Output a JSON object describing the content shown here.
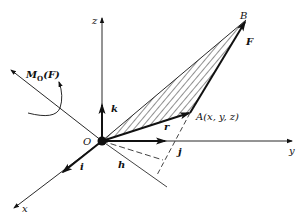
{
  "diagram": {
    "axes": {
      "x_label": "x",
      "y_label": "y",
      "z_label": "z"
    },
    "unit_vectors": {
      "i": "i",
      "j": "j",
      "k": "k"
    },
    "points": {
      "origin": "O",
      "A": "A(x, y, z)",
      "B": "B"
    },
    "vectors": {
      "position": "r",
      "force": "F"
    },
    "moment_label_main": "M",
    "moment_label_sub": "O",
    "moment_label_tail": "(F)",
    "arm_label": "h",
    "colors": {
      "line": "#111111",
      "hatch": "#222222",
      "background": "#ffffff"
    }
  }
}
